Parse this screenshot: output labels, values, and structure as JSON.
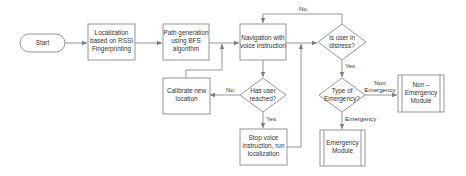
{
  "diagram": {
    "type": "flowchart",
    "colors": {
      "stroke": "#8a8a8a",
      "text": "#333333",
      "background": "#ffffff"
    },
    "nodes": {
      "start": {
        "shape": "terminator",
        "lines": [
          "Start"
        ]
      },
      "localization": {
        "shape": "process",
        "lines": [
          "Localization",
          "based on RSSI",
          "Fingerprinting"
        ]
      },
      "path_generation": {
        "shape": "process",
        "lines": [
          "Path generation",
          "using BFS",
          "algorithm"
        ]
      },
      "navigation": {
        "shape": "process",
        "lines": [
          "Navigation with",
          "voice instruction"
        ]
      },
      "is_distress": {
        "shape": "decision",
        "lines": [
          "Is user in",
          "distress?"
        ]
      },
      "has_reached": {
        "shape": "decision",
        "lines": [
          "Has user",
          "reached?"
        ]
      },
      "calibrate": {
        "shape": "process",
        "lines": [
          "Calibrate new",
          "location"
        ]
      },
      "stop_voice": {
        "shape": "process",
        "lines": [
          "Stop voice",
          "instruction, run",
          "localization"
        ]
      },
      "type_emergency": {
        "shape": "decision",
        "lines": [
          "Type of",
          "Emergency?"
        ]
      },
      "non_emergency_module": {
        "shape": "predefined-process",
        "lines": [
          "Non –",
          "Emergency",
          "Module"
        ]
      },
      "emergency_module": {
        "shape": "predefined-process",
        "lines": [
          "Emergency",
          "Module"
        ]
      }
    },
    "edge_labels": {
      "distress_no": "No",
      "distress_yes": "Yes",
      "reached_no": "No",
      "reached_yes": "Yes",
      "non_emergency_line1": "Non",
      "non_emergency_line2": "Emergency",
      "emergency": "Emergency"
    },
    "edges": [
      {
        "from": "start",
        "to": "localization"
      },
      {
        "from": "localization",
        "to": "path_generation"
      },
      {
        "from": "path_generation",
        "to": "navigation"
      },
      {
        "from": "navigation",
        "to": "is_distress"
      },
      {
        "from": "is_distress",
        "to": "navigation",
        "label": "No"
      },
      {
        "from": "is_distress",
        "to": "type_emergency",
        "label": "Yes"
      },
      {
        "from": "navigation",
        "to": "has_reached"
      },
      {
        "from": "has_reached",
        "to": "calibrate",
        "label": "No"
      },
      {
        "from": "calibrate",
        "to": "navigation"
      },
      {
        "from": "has_reached",
        "to": "stop_voice",
        "label": "Yes"
      },
      {
        "from": "stop_voice",
        "to": "is_distress"
      },
      {
        "from": "type_emergency",
        "to": "non_emergency_module",
        "label": "Non Emergency"
      },
      {
        "from": "type_emergency",
        "to": "emergency_module",
        "label": "Emergency"
      }
    ]
  }
}
